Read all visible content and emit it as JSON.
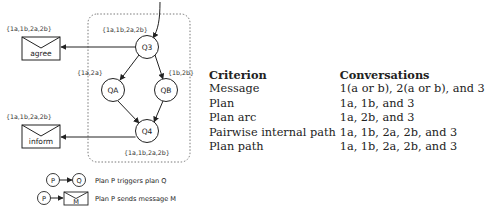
{
  "diagram": {
    "nodes": {
      "q3": {
        "label": "Q3",
        "set": "{1a,1b,2a,2b}"
      },
      "qa": {
        "label": "QA",
        "set": "{1a,2a}"
      },
      "qb": {
        "label": "QB",
        "set": "{1b,2b}"
      },
      "q4": {
        "label": "Q4",
        "set": "{1a,1b,2a,2b}"
      }
    },
    "messages": {
      "agree": {
        "label": "agree",
        "set": "{1a,1b,2a,2b}"
      },
      "inform": {
        "label": "inform",
        "set": "{1a,1b,2a,2b}"
      }
    },
    "legend": {
      "plan_p": "P",
      "plan_q": "Q",
      "message_m": "M",
      "triggers_text": "Plan P triggers plan Q",
      "sends_text": "Plan P sends message M"
    }
  },
  "table": {
    "headers": [
      "Criterion",
      "Conversations"
    ],
    "rows": [
      [
        "Message",
        "1(a or b), 2(a or b), and 3"
      ],
      [
        "Plan",
        "1a, 1b, and 3"
      ],
      [
        "Plan arc",
        "1a, 2b, and 3"
      ],
      [
        "Pairwise internal path",
        "1a, 1b, 2a, 2b, and 3"
      ],
      [
        "Plan path",
        "1a, 1b, 2a, 2b, and 3"
      ]
    ]
  }
}
